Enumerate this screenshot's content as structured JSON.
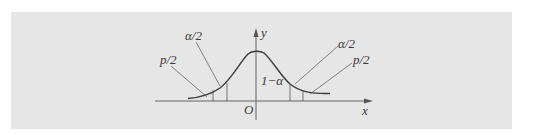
{
  "figure": {
    "type": "normal-distribution-diagram",
    "colors": {
      "background": "#ffffff",
      "panel": "#e6e6e6",
      "ink": "#3a3a3a"
    },
    "axes": {
      "x_label": "x",
      "y_label": "y",
      "origin_label": "O"
    },
    "regions": {
      "center_label": "1−α",
      "left_inner_label": "α/2",
      "left_outer_label": "p/2",
      "right_inner_label": "α/2",
      "right_outer_label": "p/2"
    }
  }
}
